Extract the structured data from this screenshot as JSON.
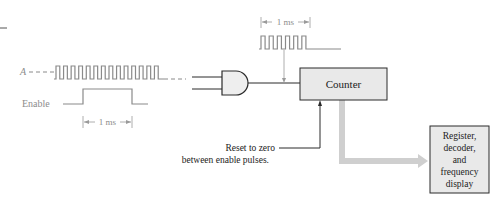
{
  "diagram": {
    "signals": {
      "a_label": "A",
      "enable_label": "Enable",
      "enable_pulse_width": "1 ms",
      "gated_pulse_width": "1 ms",
      "a_pulse_count": 14,
      "gated_pulse_count": 6
    },
    "blocks": {
      "counter": "Counter",
      "display_lines": [
        "Register,",
        "decoder,",
        "and",
        "frequency",
        "display"
      ]
    },
    "annotations": {
      "reset_line1": "Reset to zero",
      "reset_line2": "between enable pulses."
    },
    "colors": {
      "waveform": "#8a8a8a",
      "line": "#2a2a2a",
      "block_fill": "#e9e9e9",
      "gate_fill": "#eeeeee",
      "thick_arrow": "#cfcfcf"
    }
  }
}
